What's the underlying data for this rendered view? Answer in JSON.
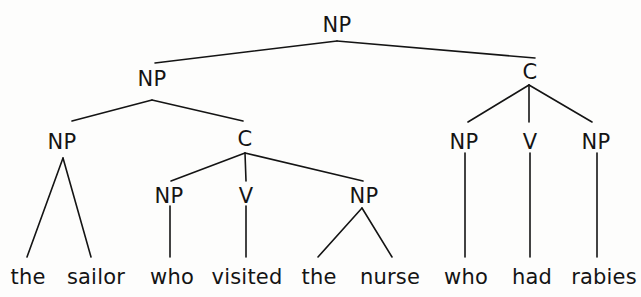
{
  "diagram": {
    "type": "syntax-tree",
    "sentence": "the sailor who visited the nurse who had rabies",
    "ink_color": "#141414",
    "background_color": "#fdfdfc",
    "nodes": [
      {
        "id": "n0",
        "label": "NP",
        "x": 337,
        "y": 25,
        "level": 0
      },
      {
        "id": "n1",
        "label": "NP",
        "x": 152,
        "y": 79,
        "level": 1
      },
      {
        "id": "n2",
        "label": "C",
        "x": 530,
        "y": 72,
        "level": 1
      },
      {
        "id": "n3",
        "label": "NP",
        "x": 62,
        "y": 142,
        "level": 2
      },
      {
        "id": "n4",
        "label": "C",
        "x": 245,
        "y": 139,
        "level": 2
      },
      {
        "id": "n5",
        "label": "NP",
        "x": 464,
        "y": 142,
        "level": 2
      },
      {
        "id": "n6",
        "label": "V",
        "x": 530,
        "y": 142,
        "level": 2
      },
      {
        "id": "n7",
        "label": "NP",
        "x": 596,
        "y": 142,
        "level": 2
      },
      {
        "id": "n8",
        "label": "NP",
        "x": 169,
        "y": 196,
        "level": 3
      },
      {
        "id": "n9",
        "label": "V",
        "x": 246,
        "y": 196,
        "level": 3
      },
      {
        "id": "n10",
        "label": "NP",
        "x": 364,
        "y": 196,
        "level": 3
      }
    ],
    "leaves": [
      {
        "id": "w1",
        "label": "the",
        "x": 28,
        "y": 277
      },
      {
        "id": "w2",
        "label": "sailor",
        "x": 96,
        "y": 277
      },
      {
        "id": "w3",
        "label": "who",
        "x": 172,
        "y": 277
      },
      {
        "id": "w4",
        "label": "visited",
        "x": 247,
        "y": 277
      },
      {
        "id": "w5",
        "label": "the",
        "x": 319,
        "y": 277
      },
      {
        "id": "w6",
        "label": "nurse",
        "x": 390,
        "y": 277
      },
      {
        "id": "w7",
        "label": "who",
        "x": 466,
        "y": 277
      },
      {
        "id": "w8",
        "label": "had",
        "x": 532,
        "y": 277
      },
      {
        "id": "w9",
        "label": "rabies",
        "x": 604,
        "y": 277
      }
    ],
    "edges": [
      {
        "from": "n0",
        "to": "n1",
        "x1": 337,
        "y1": 41,
        "x2": 155,
        "y2": 63
      },
      {
        "from": "n0",
        "to": "n2",
        "x1": 337,
        "y1": 41,
        "x2": 535,
        "y2": 58
      },
      {
        "from": "n1",
        "to": "n3",
        "x1": 152,
        "y1": 100,
        "x2": 72,
        "y2": 121
      },
      {
        "from": "n1",
        "to": "n4",
        "x1": 152,
        "y1": 100,
        "x2": 243,
        "y2": 121
      },
      {
        "from": "n2",
        "to": "n5",
        "x1": 529,
        "y1": 85,
        "x2": 468,
        "y2": 122
      },
      {
        "from": "n2",
        "to": "n6",
        "x1": 529,
        "y1": 85,
        "x2": 529,
        "y2": 122
      },
      {
        "from": "n2",
        "to": "n7",
        "x1": 529,
        "y1": 85,
        "x2": 592,
        "y2": 122
      },
      {
        "from": "n3",
        "to": "w1",
        "x1": 63,
        "y1": 158,
        "x2": 27,
        "y2": 257
      },
      {
        "from": "n3",
        "to": "w2",
        "x1": 63,
        "y1": 158,
        "x2": 91,
        "y2": 257
      },
      {
        "from": "n4",
        "to": "n8",
        "x1": 245,
        "y1": 153,
        "x2": 171,
        "y2": 181
      },
      {
        "from": "n4",
        "to": "n9",
        "x1": 245,
        "y1": 153,
        "x2": 246,
        "y2": 181
      },
      {
        "from": "n4",
        "to": "n10",
        "x1": 245,
        "y1": 153,
        "x2": 363,
        "y2": 181
      },
      {
        "from": "n8",
        "to": "w3",
        "x1": 170,
        "y1": 206,
        "x2": 170,
        "y2": 257
      },
      {
        "from": "n9",
        "to": "w4",
        "x1": 246,
        "y1": 206,
        "x2": 246,
        "y2": 257
      },
      {
        "from": "n10",
        "to": "w5",
        "x1": 362,
        "y1": 208,
        "x2": 318,
        "y2": 257
      },
      {
        "from": "n10",
        "to": "w6",
        "x1": 362,
        "y1": 208,
        "x2": 392,
        "y2": 257
      },
      {
        "from": "n5",
        "to": "w7",
        "x1": 465,
        "y1": 153,
        "x2": 465,
        "y2": 257
      },
      {
        "from": "n6",
        "to": "w8",
        "x1": 530,
        "y1": 153,
        "x2": 530,
        "y2": 257
      },
      {
        "from": "n7",
        "to": "w9",
        "x1": 597,
        "y1": 153,
        "x2": 597,
        "y2": 257
      }
    ]
  }
}
